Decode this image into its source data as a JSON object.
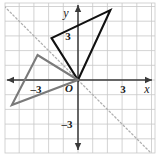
{
  "figure": {
    "kind": "coordinate-plane-diagram",
    "width": 162,
    "height": 159,
    "background": "#ffffff"
  },
  "chart_data": {
    "type": "scatter",
    "title": "",
    "xlabel": "x",
    "ylabel": "y",
    "xlim": [
      -5,
      5.2
    ],
    "ylim": [
      -5.4,
      4.8
    ],
    "grid": true,
    "legend": false,
    "origin_label": "O",
    "x_ticks": [
      -3,
      3
    ],
    "x_tick_labels": [
      "–3",
      "3"
    ],
    "y_ticks": [
      3,
      -3
    ],
    "y_tick_labels": [
      "3",
      "–3"
    ],
    "grid_step": 1,
    "grid_color": "#c8c8c8",
    "axis_color": "#3a3a3a",
    "series": [
      {
        "name": "preimage-triangle",
        "kind": "polygon",
        "color": "#111111",
        "line_width": 2.1,
        "points": [
          [
            0,
            0
          ],
          [
            -1.8,
            2.85
          ],
          [
            2.2,
            4.75
          ]
        ]
      },
      {
        "name": "image-triangle",
        "kind": "polygon",
        "color": "#7a7a7a",
        "line_width": 2.1,
        "points": [
          [
            0,
            0
          ],
          [
            -2.75,
            1.7
          ],
          [
            -4.5,
            -1.7
          ]
        ]
      },
      {
        "name": "line-of-reflection",
        "kind": "line",
        "color": "#b0b0b0",
        "style": "dashed",
        "equation": "y = -x",
        "points": [
          [
            -5,
            5
          ],
          [
            5.2,
            -5.2
          ]
        ]
      }
    ]
  },
  "labels": {
    "x_axis": "x",
    "y_axis": "y",
    "origin": "O",
    "x_pos_3": "3",
    "x_neg_3": "–3",
    "y_pos_3": "3",
    "y_neg_3": "–3"
  }
}
